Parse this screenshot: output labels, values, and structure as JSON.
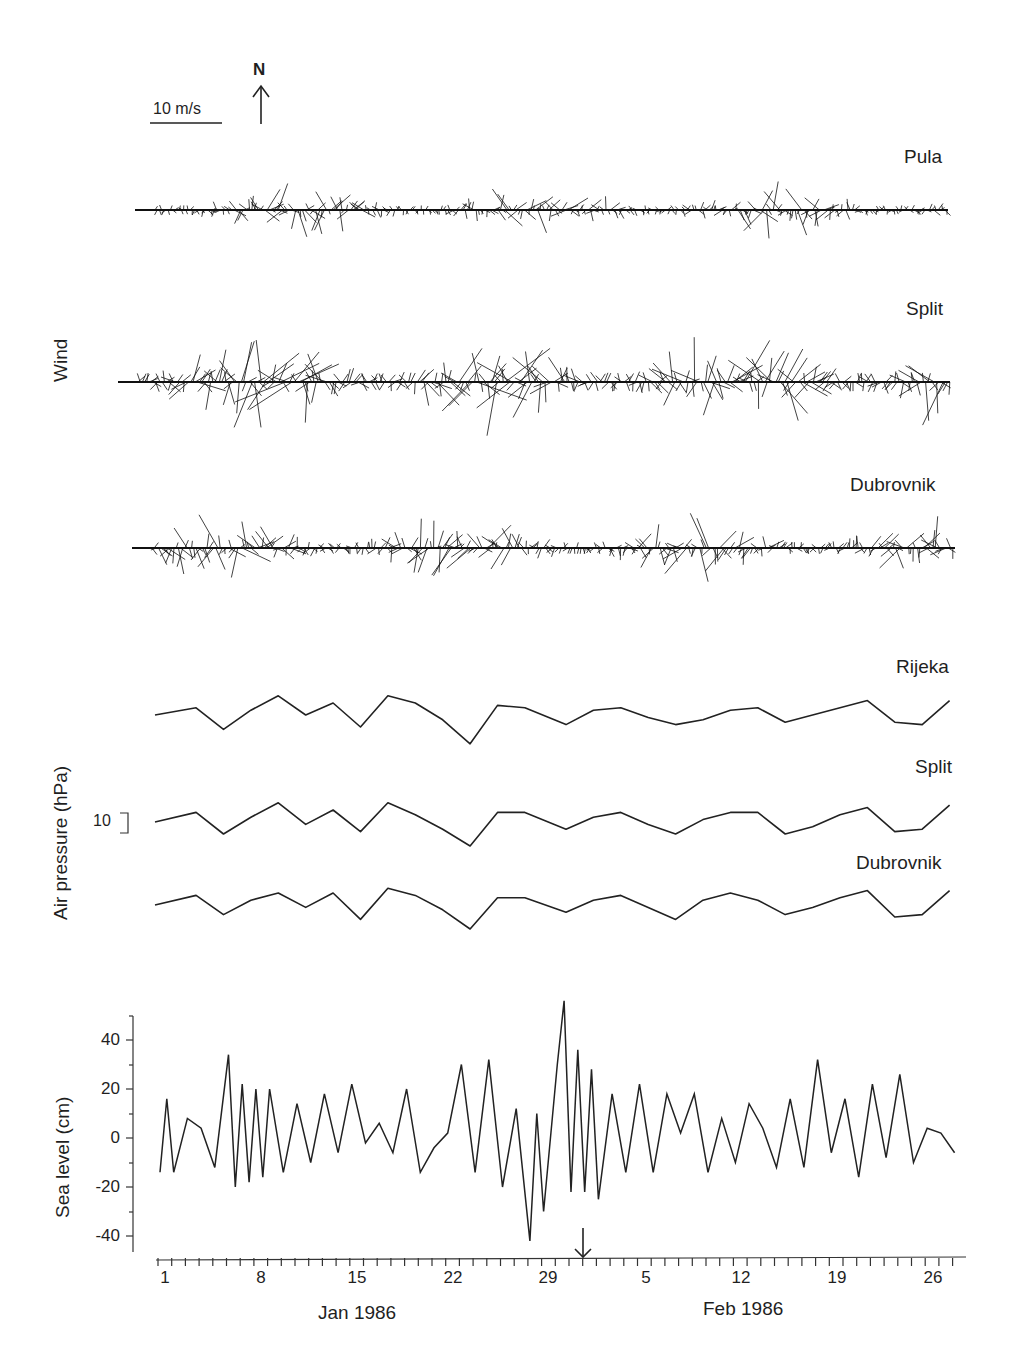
{
  "legend": {
    "scale_label": "10 m/s",
    "north_label": "N"
  },
  "panels": {
    "wind": {
      "ylabel": "Wind",
      "stations": [
        "Pula",
        "Split",
        "Dubrovnik"
      ]
    },
    "pressure": {
      "ylabel": "Air pressure (hPa)",
      "scale_bar_label": "10",
      "stations": [
        "Rijeka",
        "Split",
        "Dubrovnik"
      ]
    },
    "sea_level": {
      "ylabel": "Sea level (cm)",
      "yticks": [
        "40",
        "20",
        "0",
        "-20",
        "-40"
      ]
    }
  },
  "xaxis": {
    "tick_labels": [
      "1",
      "8",
      "15",
      "22",
      "29",
      "5",
      "12",
      "19",
      "26"
    ],
    "month_labels": [
      "Jan 1986",
      "Feb 1986"
    ],
    "event_marker": "arrow at 31 Jan / 1 Feb 1986"
  },
  "chart_data": [
    {
      "type": "vector-stickplot",
      "title": "Wind",
      "series": [
        {
          "name": "Pula",
          "max_speed_ms": 14
        },
        {
          "name": "Split",
          "max_speed_ms": 28
        },
        {
          "name": "Dubrovnik",
          "max_speed_ms": 18
        }
      ],
      "scale": "10 m/s",
      "orientation": "N up",
      "x": "1 Jan 1986 – 28 Feb 1986"
    },
    {
      "type": "line",
      "title": "Air pressure",
      "ylabel": "Air pressure (hPa)",
      "scale_bar": "10 hPa",
      "x": [
        1,
        4,
        6,
        8,
        10,
        12,
        14,
        16,
        18,
        20,
        22,
        24,
        26,
        28,
        31,
        33,
        35,
        37,
        39,
        41,
        43,
        45,
        47,
        49,
        51,
        53,
        55,
        57,
        59
      ],
      "series": [
        {
          "name": "Rijeka",
          "values": [
            0,
            3,
            -6,
            2,
            8,
            0,
            5,
            -5,
            8,
            5,
            -2,
            -12,
            4,
            3,
            -4,
            2,
            3,
            -1,
            -4,
            -2,
            2,
            3,
            -3,
            0,
            3,
            6,
            -3,
            -4,
            6
          ]
        },
        {
          "name": "Split",
          "values": [
            0,
            4,
            -5,
            2,
            8,
            -1,
            5,
            -4,
            8,
            3,
            -3,
            -10,
            4,
            4,
            -3,
            2,
            4,
            -1,
            -5,
            1,
            4,
            4,
            -5,
            -2,
            3,
            6,
            -4,
            -3,
            7
          ]
        },
        {
          "name": "Dubrovnik",
          "values": [
            0,
            4,
            -4,
            2,
            5,
            -1,
            5,
            -6,
            7,
            4,
            -2,
            -10,
            3,
            3,
            -3,
            2,
            4,
            -1,
            -6,
            2,
            5,
            2,
            -4,
            -1,
            3,
            6,
            -5,
            -4,
            6
          ]
        }
      ]
    },
    {
      "type": "line",
      "title": "Sea level",
      "ylabel": "Sea level (cm)",
      "ylim": [
        -50,
        50
      ],
      "yticks": [
        -40,
        -20,
        0,
        20,
        40
      ],
      "x": [
        1,
        1.5,
        2,
        3,
        4,
        5,
        6,
        6.5,
        7,
        7.5,
        8,
        8.5,
        9,
        10,
        11,
        12,
        13,
        14,
        15,
        16,
        17,
        18,
        19,
        20,
        21,
        22,
        23,
        24,
        25,
        26,
        27,
        28,
        28.5,
        29,
        30,
        30.5,
        31,
        31.5,
        32,
        32.5,
        33,
        34,
        35,
        36,
        37,
        38,
        39,
        40,
        41,
        42,
        43,
        44,
        45,
        46,
        47,
        48,
        49,
        50,
        51,
        52,
        53,
        54,
        55,
        56,
        57,
        58,
        59
      ],
      "values": [
        -14,
        16,
        -14,
        8,
        4,
        -12,
        34,
        -20,
        22,
        -18,
        20,
        -16,
        20,
        -14,
        14,
        -10,
        18,
        -6,
        22,
        -2,
        6,
        -6,
        20,
        -14,
        -4,
        2,
        30,
        -14,
        32,
        -20,
        12,
        -42,
        10,
        -30,
        30,
        56,
        -22,
        36,
        -22,
        28,
        -25,
        18,
        -14,
        22,
        -14,
        18,
        2,
        18,
        -14,
        8,
        -10,
        14,
        4,
        -12,
        16,
        -12,
        32,
        -6,
        16,
        -16,
        22,
        -8,
        26,
        -10,
        4,
        2,
        -6
      ]
    }
  ]
}
